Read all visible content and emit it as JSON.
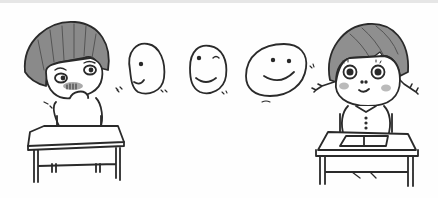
{
  "illustration": {
    "title": "",
    "description": "Cartoon of a shy boy at a desk and a smiling girl at a desk, with three faces between them progressing from neutral to a big smile",
    "characters": [
      {
        "name": "boy",
        "mood": "shy, blushing, hand on mouth"
      },
      {
        "name": "girl",
        "mood": "smiling, pigtails, book on desk"
      }
    ],
    "faces": [
      {
        "name": "face-1",
        "expression": "slight smile"
      },
      {
        "name": "face-2",
        "expression": "smile"
      },
      {
        "name": "face-3",
        "expression": "big smile"
      }
    ],
    "colors": {
      "line": "#2a2a2a",
      "hair": "#8c8c8c",
      "blush": "#b8b8b8",
      "background": "#fefefe"
    }
  }
}
